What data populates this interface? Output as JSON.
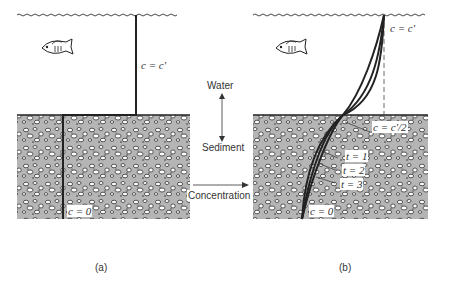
{
  "panels": [
    {
      "id": "a",
      "caption": "(a)",
      "labels": {
        "water_conc": "c = c'",
        "sediment_conc": "c = 0"
      }
    },
    {
      "id": "b",
      "caption": "(b)",
      "labels": {
        "water_conc": "c = c'",
        "interface_conc": "c = c'/2",
        "sediment_conc": "c = 0",
        "times": [
          "t = 1",
          "t = 2",
          "t = 3"
        ]
      }
    }
  ],
  "center": {
    "water_label": "Water",
    "sediment_label": "Sediment",
    "concentration_label": "Concentration"
  },
  "colors": {
    "line": "#222222",
    "sediment_bg": "#b8b8b8",
    "pebble": "#ffffff"
  }
}
